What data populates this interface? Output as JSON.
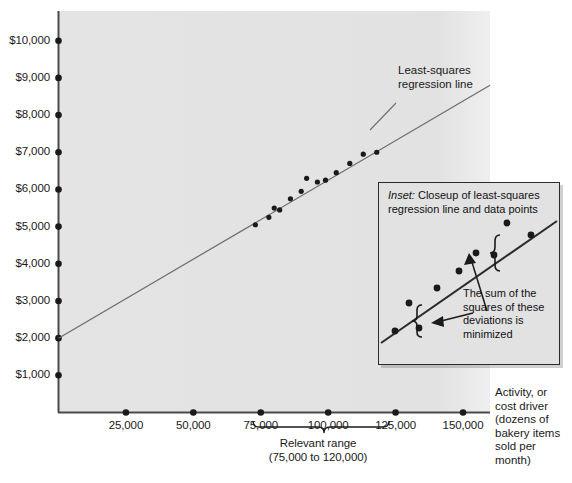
{
  "chart_data": {
    "type": "scatter",
    "title": "",
    "xlabel": "Activity, or cost driver (dozens of bakery items sold per month)",
    "ylabel": "",
    "xlim": [
      0,
      160000
    ],
    "ylim": [
      0,
      10800
    ],
    "grid": false,
    "legend": "none",
    "x_ticks": [
      "25,000",
      "50,000",
      "75,000",
      "100,000",
      "125,000",
      "150,000"
    ],
    "x_tick_values": [
      25000,
      50000,
      75000,
      100000,
      125000,
      150000
    ],
    "y_ticks": [
      "$1,000",
      "$2,000",
      "$3,000",
      "$4,000",
      "$5,000",
      "$6,000",
      "$7,000",
      "$8,000",
      "$9,000",
      "$10,000"
    ],
    "y_tick_values": [
      1000,
      2000,
      3000,
      4000,
      5000,
      6000,
      7000,
      8000,
      9000,
      10000
    ],
    "series": [
      {
        "name": "Cost observations",
        "points": [
          [
            73000,
            5050
          ],
          [
            78000,
            5250
          ],
          [
            80000,
            5500
          ],
          [
            82000,
            5450
          ],
          [
            86000,
            5750
          ],
          [
            90000,
            5950
          ],
          [
            92000,
            6300
          ],
          [
            96000,
            6200
          ],
          [
            99000,
            6250
          ],
          [
            103000,
            6450
          ],
          [
            108000,
            6700
          ],
          [
            113000,
            6950
          ],
          [
            118000,
            7000
          ]
        ]
      }
    ],
    "regression_line": {
      "name": "Least-squares regression line",
      "intercept": 2000,
      "slope_per_unit": 0.0425,
      "x_from": 0,
      "x_to": 160000,
      "y_from": 2000,
      "y_to": 8800
    },
    "annotations": {
      "regression_label": "Least-squares\nregression line",
      "relevant_range_label": "Relevant range",
      "relevant_range_sub": "(75,000 to 120,000)",
      "relevant_range_from": 75000,
      "relevant_range_to": 125000,
      "axis_caption_lines": [
        "Activity, or",
        "cost driver",
        "(dozens of",
        "bakery items",
        "sold per",
        "month)"
      ]
    },
    "inset": {
      "caption_italic": "Inset:",
      "caption_rest": " Closeup of least-squares",
      "caption_line2": "regression line and data points",
      "note": "The sum of the squares of these deviations is minimized",
      "note_lines": [
        "The sum of the",
        "squares of these",
        "deviations is",
        "minimized"
      ],
      "points": [
        [
          16,
          148
        ],
        [
          40,
          145
        ],
        [
          30,
          120
        ],
        [
          58,
          105
        ],
        [
          80,
          88
        ],
        [
          97,
          70
        ],
        [
          115,
          72
        ],
        [
          128,
          40
        ],
        [
          152,
          52
        ]
      ],
      "line_from": [
        2,
        160
      ],
      "line_to": [
        178,
        38
      ]
    }
  },
  "colors": {
    "plot_background": "#e3e3e3",
    "axis": "#4a4a4a",
    "point": "#1a1a1a",
    "regression_line": "#6b6b6b",
    "inset_background": "#e2e2e2",
    "inset_border": "#2b2b2b",
    "inset_line": "#2b2b2b",
    "text": "#1a1a1a"
  }
}
